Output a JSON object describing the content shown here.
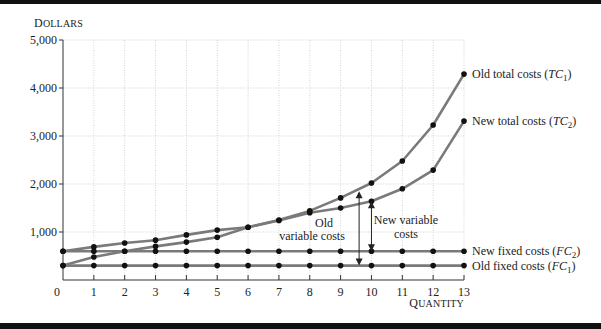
{
  "chart_data": {
    "type": "line",
    "title": "",
    "ylabel": "Dollars",
    "xlabel": "Quantity",
    "x": [
      0,
      1,
      2,
      3,
      4,
      5,
      6,
      7,
      8,
      9,
      10,
      11,
      12,
      13
    ],
    "xlim": [
      0,
      13
    ],
    "ylim": [
      0,
      5000
    ],
    "yticks": [
      1000,
      2000,
      3000,
      4000,
      5000
    ],
    "ytick_labels": [
      "1,000",
      "2,000",
      "3,000",
      "4,000",
      "5,000"
    ],
    "xtick_labels": [
      "0",
      "1",
      "2",
      "3",
      "4",
      "5",
      "6",
      "7",
      "8",
      "9",
      "10",
      "11",
      "12",
      "13"
    ],
    "grid": true,
    "series": [
      {
        "name": "Old total costs (TC1)",
        "label_main": "Old total costs (",
        "label_var": "TC",
        "label_sub": "1",
        "values": [
          300,
          480,
          600,
          700,
          790,
          890,
          1100,
          1250,
          1440,
          1710,
          2020,
          2480,
          3230,
          4290
        ]
      },
      {
        "name": "New total costs (TC2)",
        "label_main": "New total costs (",
        "label_var": "TC",
        "label_sub": "2",
        "values": [
          600,
          690,
          770,
          830,
          940,
          1040,
          1100,
          1240,
          1400,
          1500,
          1640,
          1900,
          2290,
          3310
        ]
      },
      {
        "name": "New fixed costs (FC2)",
        "label_main": "New fixed costs (",
        "label_var": "FC",
        "label_sub": "2",
        "values": [
          600,
          600,
          600,
          600,
          600,
          600,
          600,
          600,
          600,
          600,
          600,
          600,
          600,
          600
        ]
      },
      {
        "name": "Old fixed costs (FC1)",
        "label_main": "Old fixed costs (",
        "label_var": "FC",
        "label_sub": "1",
        "values": [
          300,
          300,
          300,
          300,
          300,
          300,
          300,
          300,
          300,
          300,
          300,
          300,
          300,
          300
        ]
      }
    ],
    "annotations": [
      {
        "text_lines": [
          "Old",
          "variable costs"
        ],
        "arrow_x": 9.6,
        "from": 300,
        "to": 1850
      },
      {
        "text_lines": [
          "New variable",
          "costs"
        ],
        "arrow_x": 10,
        "from": 600,
        "to": 1640
      }
    ],
    "line_color": "#7a7a7a",
    "marker_color": "#111111"
  },
  "axis": {
    "ylabel_display": "Dollars",
    "xlabel_display": "Quantity"
  }
}
